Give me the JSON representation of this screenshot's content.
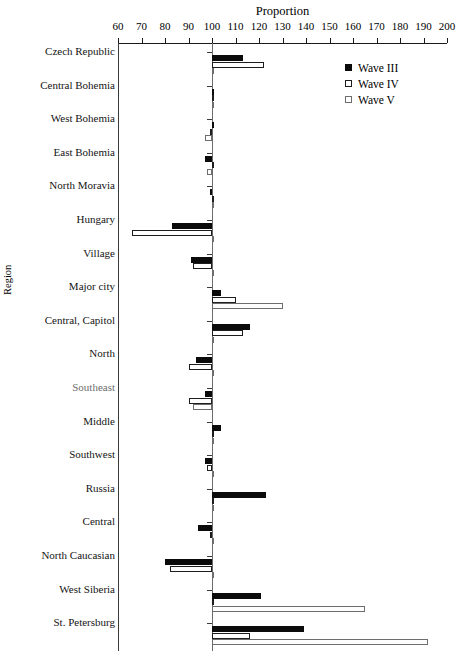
{
  "chart_data": {
    "type": "bar",
    "orientation": "horizontal",
    "title": "Proportion",
    "xlabel": "Proportion",
    "ylabel": "Region",
    "xlim": [
      60,
      200
    ],
    "xticks": [
      60,
      70,
      80,
      90,
      100,
      110,
      120,
      130,
      140,
      150,
      160,
      170,
      180,
      190,
      200
    ],
    "grid": false,
    "reference_line": 100,
    "legend_position": "top-right",
    "legend": [
      "Wave III",
      "Wave IV",
      "Wave V"
    ],
    "series": [
      {
        "name": "Wave III",
        "fill": "#0b0b0b",
        "style": "filled"
      },
      {
        "name": "Wave IV",
        "fill": "#ffffff",
        "style": "open"
      },
      {
        "name": "Wave V",
        "fill": "#ffffff",
        "style": "open-gray"
      }
    ],
    "categories": [
      "Czech Republic",
      "Central Bohemia",
      "West Bohemia",
      "East Bohemia",
      "North Moravia",
      "Hungary",
      "Village",
      "Major city",
      "Central, Capitol",
      "North",
      "Southeast",
      "Middle",
      "Southwest",
      "Russia",
      "Central",
      "North Caucasian",
      "West Siberia",
      "St. Petersburg"
    ],
    "values": {
      "Wave III": [
        113,
        100.5,
        100,
        97,
        99,
        83,
        91,
        104,
        116,
        93,
        97,
        104,
        97,
        123,
        94,
        80,
        121,
        139
      ],
      "Wave IV": [
        122,
        100,
        99,
        100,
        100,
        66,
        92,
        110,
        113,
        90,
        90,
        100,
        98,
        100,
        99,
        82,
        100,
        116
      ],
      "Wave V": [
        100,
        100,
        97,
        98,
        100,
        100,
        100,
        130,
        100,
        100,
        92,
        100,
        100,
        100,
        100,
        100,
        165,
        192
      ]
    }
  }
}
